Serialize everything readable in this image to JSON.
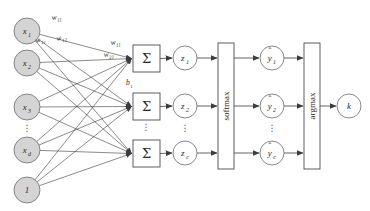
{
  "diagram": {
    "colors": {
      "input_node_fill": "#d4d4d4",
      "node_stroke": "#7a7a7a",
      "plain_node_fill": "#ffffff",
      "box_stroke": "#4d4d4d",
      "edge_stroke": "#3c3c3c",
      "text": "#2b2b2b",
      "background": "#ffffff"
    },
    "input_layer": {
      "name": "input-layer",
      "nodes": [
        {
          "id": "x1",
          "base": "x",
          "sub": "1",
          "kind": "input",
          "cx": 27,
          "cy": 31,
          "r": 13
        },
        {
          "id": "x2",
          "base": "x",
          "sub": "2",
          "kind": "input",
          "cx": 27,
          "cy": 63,
          "r": 13
        },
        {
          "id": "x3",
          "base": "x",
          "sub": "3",
          "kind": "input",
          "cx": 27,
          "cy": 107,
          "r": 13
        },
        {
          "id": "xd",
          "base": "x",
          "sub": "d",
          "kind": "input",
          "cx": 27,
          "cy": 150,
          "r": 13
        },
        {
          "id": "bias",
          "base": "1",
          "sub": "",
          "kind": "bias",
          "cx": 27,
          "cy": 190,
          "r": 13
        }
      ],
      "ellipsis": {
        "label": "⋮",
        "x": 27,
        "y": 131
      }
    },
    "weight_labels": [
      {
        "id": "w11-top",
        "base": "w",
        "sub": "11",
        "x": 52,
        "y": 20,
        "rotate": -8
      },
      {
        "id": "w1c",
        "base": "w",
        "sub": "1c",
        "x": 36,
        "y": 43,
        "rotate": -14
      },
      {
        "id": "w12",
        "base": "w",
        "sub": "12",
        "x": 57,
        "y": 41,
        "rotate": -14
      },
      {
        "id": "w11-mid",
        "base": "w",
        "sub": "11",
        "x": 111,
        "y": 45,
        "rotate": -8
      },
      {
        "id": "w21",
        "base": "w",
        "sub": "21",
        "x": 104,
        "y": 57,
        "rotate": -6
      }
    ],
    "bias_label": {
      "id": "b1",
      "base": "b",
      "sub": "1",
      "x": 126,
      "y": 85
    },
    "sum_layer": {
      "name": "summation-layer",
      "glyph": "Σ",
      "boxes": [
        {
          "id": "sum1",
          "x": 133,
          "y": 45,
          "w": 27,
          "h": 27
        },
        {
          "id": "sum2",
          "x": 133,
          "y": 93,
          "w": 27,
          "h": 27
        },
        {
          "id": "sum3",
          "x": 133,
          "y": 140,
          "w": 27,
          "h": 27
        }
      ],
      "ellipsis": {
        "label": "⋮",
        "x": 146,
        "y": 130
      }
    },
    "z_layer": {
      "name": "preactivation-layer",
      "nodes": [
        {
          "id": "z1",
          "base": "z",
          "sub": "1",
          "cx": 185,
          "cy": 58,
          "r": 12
        },
        {
          "id": "z2",
          "base": "z",
          "sub": "2",
          "cx": 185,
          "cy": 106,
          "r": 12
        },
        {
          "id": "zc",
          "base": "z",
          "sub": "c",
          "cx": 185,
          "cy": 153,
          "r": 12
        }
      ],
      "ellipsis": {
        "label": "⋮",
        "x": 185,
        "y": 131
      }
    },
    "softmax_box": {
      "id": "softmax",
      "label": "softmax",
      "x": 218,
      "y": 43,
      "w": 16,
      "h": 126
    },
    "yhat_layer": {
      "name": "probability-layer",
      "nodes": [
        {
          "id": "yhat1",
          "base": "y",
          "sub": "1",
          "cx": 272,
          "cy": 58,
          "r": 12
        },
        {
          "id": "yhat2",
          "base": "y",
          "sub": "2",
          "cx": 272,
          "cy": 106,
          "r": 12
        },
        {
          "id": "yhatc",
          "base": "y",
          "sub": "c",
          "cx": 272,
          "cy": 153,
          "r": 12
        }
      ],
      "ellipsis": {
        "label": "⋮",
        "x": 272,
        "y": 131
      }
    },
    "argmax_box": {
      "id": "argmax",
      "label": "argmax",
      "x": 304,
      "y": 43,
      "w": 16,
      "h": 126
    },
    "output_node": {
      "id": "k",
      "base": "k",
      "sub": "",
      "cx": 349,
      "cy": 106,
      "r": 12
    }
  }
}
